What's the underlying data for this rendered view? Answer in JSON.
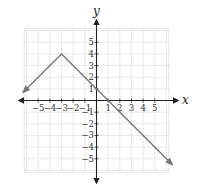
{
  "chart_data": {
    "type": "line",
    "title": "",
    "xlabel": "x",
    "ylabel": "y",
    "xlim": [
      -6.2,
      6.2
    ],
    "ylim": [
      -6.2,
      6.2
    ],
    "grid": true,
    "legend": null,
    "x_ticks": [
      -5,
      -4,
      -3,
      -2,
      -1,
      1,
      2,
      3,
      4,
      5
    ],
    "y_ticks": [
      5,
      4,
      3,
      2,
      1,
      -1,
      -2,
      -3,
      -4,
      -5
    ],
    "x_tick_labels": [
      "−5",
      "−4",
      "−3",
      "−2",
      "−1",
      "1",
      "2",
      "3",
      "4",
      "5"
    ],
    "y_tick_labels": [
      "5",
      "4",
      "3",
      "2",
      "1",
      "−1",
      "−2",
      "−3",
      "−4",
      "−5"
    ],
    "series": [
      {
        "name": "absolute-value-like piecewise line",
        "color": "#777777",
        "points": [
          [
            -6.3,
            0.7
          ],
          [
            -3,
            4
          ],
          [
            1,
            0
          ],
          [
            6.5,
            -5.5
          ]
        ],
        "arrows": "both-ends",
        "vertex": [
          -3,
          4
        ],
        "x_intercept": 1,
        "y_intercept": 1
      }
    ],
    "colors": {
      "grid": "#c8c8c8",
      "axis": "#222222",
      "line": "#777777"
    }
  }
}
